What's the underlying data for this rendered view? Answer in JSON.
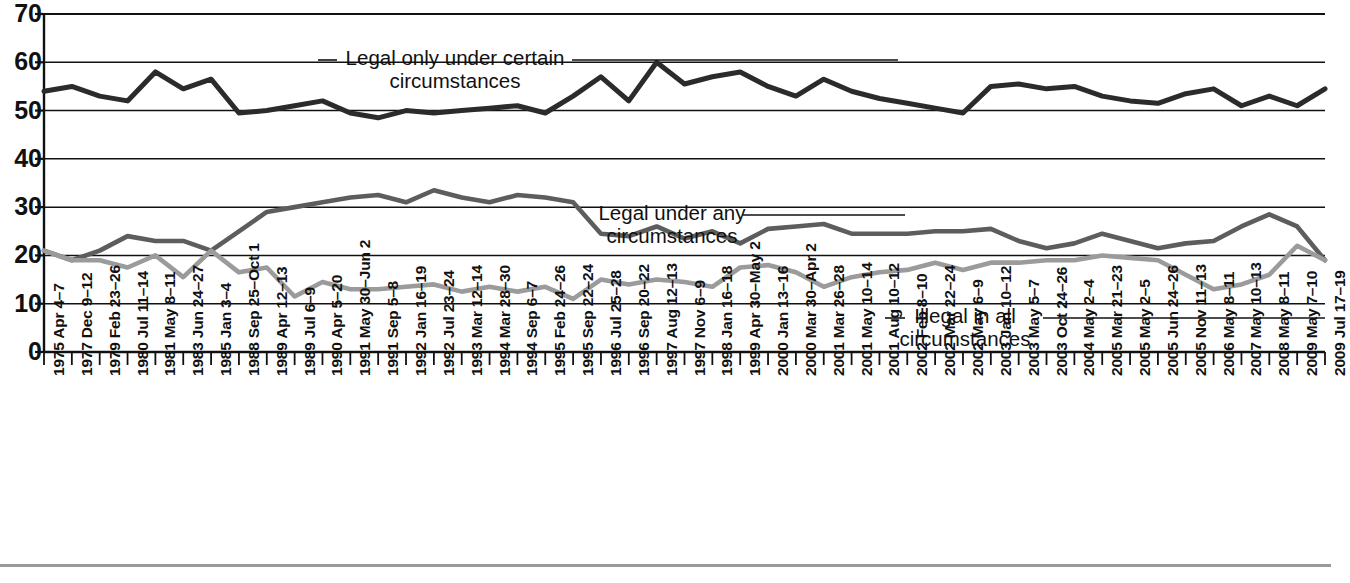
{
  "figure": {
    "name": "public-opinion-abortion-legality-line-chart",
    "bottom_rule": true
  },
  "annotations": {
    "top_line_label_1": "Legal only under certain",
    "top_line_label_2": "circumstances",
    "mid_line_label_1": "Legal under any",
    "mid_line_label_2": "circumstances",
    "low_line_label_1": "Illegal in all",
    "low_line_label_2": "circumstances"
  },
  "axis": {
    "y_ticks": [
      "70",
      "60",
      "50",
      "40",
      "30",
      "20",
      "10",
      "0"
    ]
  },
  "chart_data": {
    "type": "line",
    "title": "",
    "xlabel": "",
    "ylabel": "",
    "ylim": [
      0,
      70
    ],
    "ytick_values": [
      0,
      10,
      20,
      30,
      40,
      50,
      60,
      70
    ],
    "grid": true,
    "legend": "inline-annotations",
    "colors": {
      "legal_only_certain": "#2b2b2b",
      "legal_any": "#5d5d5d",
      "illegal_all": "#9b9b9b",
      "axis": "#111111",
      "gridline": "#111111"
    },
    "categories": [
      "1975 Apr 4–7",
      "1977 Dec 9–12",
      "1979 Feb 23–26",
      "1980 Jul 11–14",
      "1981 May 8–11",
      "1983 Jun 24–27",
      "1985 Jan 3–4",
      "1988 Sep 25–Oct 1",
      "1989 Apr 12–13",
      "1989 Jul 6–9",
      "1990 Apr 5–20",
      "1991 May 30–Jun 2",
      "1991 Sep 5–8",
      "1992 Jan 16–19",
      "1992 Jul 23–24",
      "1993 Mar 12–14",
      "1994 Mar 28–30",
      "1994 Sep 6–7",
      "1995 Feb 24–26",
      "1995 Sep 22–24",
      "1996 Jul 25–28",
      "1996 Sep 20–22",
      "1997 Aug 12–13",
      "1997 Nov 6–9",
      "1998 Jan 16–18",
      "1999 Apr 30–May 2",
      "2000 Jan 13–16",
      "2000 Mar 30–Apr 2",
      "2001 Mar 26–28",
      "2001 May 10–14",
      "2001 Aug 10–12",
      "2002 Feb 8–10",
      "2002 Mar 22–24",
      "2002 May 6–9",
      "2003 Jan 10–12",
      "2003 May 5–7",
      "2003 Oct 24–26",
      "2004 May 2–4",
      "2005 Mar 21–23",
      "2005 May 2–5",
      "2005 Jun 24–26",
      "2005 Nov 11–13",
      "2006 May 8–11",
      "2007 May 10–13",
      "2008 May 8–11",
      "2009 May 7–10",
      "2009 Jul 17–19"
    ],
    "series": [
      {
        "name": "Legal only under certain circumstances",
        "color": "#2b2b2b",
        "values": [
          54,
          55,
          53,
          52,
          58,
          54.5,
          56.5,
          49.5,
          50,
          51,
          52,
          49.5,
          48.5,
          50,
          49.5,
          50,
          50.5,
          51,
          49.5,
          53,
          57,
          52,
          60,
          55.5,
          57,
          58,
          55,
          53,
          56.5,
          54,
          52.5,
          51.5,
          50.5,
          49.5,
          55,
          55.5,
          54.5,
          55,
          53,
          52,
          51.5,
          53.5,
          54.5,
          51,
          53,
          51,
          54.5
        ]
      },
      {
        "name": "Legal under any circumstances",
        "color": "#5d5d5d",
        "values": [
          21,
          19,
          21,
          24,
          23,
          23,
          21,
          25,
          29,
          30,
          31,
          32,
          32.5,
          31,
          33.5,
          32,
          31,
          32.5,
          32,
          31,
          24.5,
          24,
          26,
          23.5,
          25,
          22.5,
          25.5,
          26,
          26.5,
          24.5,
          24.5,
          24.5,
          25,
          25,
          25.5,
          23,
          21.5,
          22.5,
          24.5,
          23,
          21.5,
          22.5,
          23,
          26,
          28.5,
          26,
          19
        ]
      },
      {
        "name": "Illegal in all circumstances",
        "color": "#9b9b9b",
        "values": [
          21,
          19,
          19,
          17.5,
          20,
          15.5,
          21,
          16.5,
          17.5,
          11.5,
          14.5,
          13,
          13,
          13.5,
          14,
          12.5,
          13.5,
          12.5,
          13.5,
          11,
          15,
          14,
          15,
          14.5,
          13.5,
          17.5,
          18,
          16.5,
          13.5,
          15.5,
          16.5,
          17,
          18.5,
          17,
          18.5,
          18.5,
          19,
          19,
          20,
          19.5,
          19,
          16,
          13,
          14,
          16,
          22,
          19
        ]
      }
    ]
  }
}
